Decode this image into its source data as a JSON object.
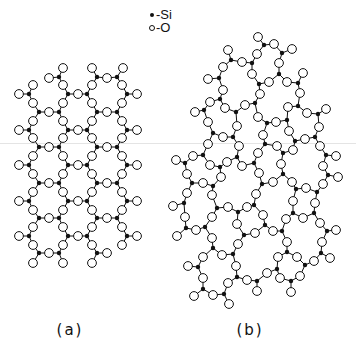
{
  "figure": {
    "width": 356,
    "height": 346,
    "colors": {
      "ink": "#111111",
      "paper": "#ffffff",
      "o_fill": "#ffffff",
      "artifact_line": "#e4e4e4"
    },
    "bond_threshold": 15.5,
    "o_radius": 4.4,
    "si_radius": 2.2
  },
  "legend": {
    "si_icon": "filled-dot",
    "si_label": "-Si",
    "o_icon": "open-circle",
    "o_label": "-O"
  },
  "panels": {
    "a": {
      "label": "(a)",
      "description": "ordered crystalline SiO2 lattice",
      "si": [
        [
          59,
          77
        ],
        [
          97,
          77
        ],
        [
          117,
          77
        ],
        [
          29,
          94
        ],
        [
          68,
          94
        ],
        [
          87,
          94
        ],
        [
          127,
          94
        ],
        [
          39,
          112
        ],
        [
          59,
          112
        ],
        [
          97,
          112
        ],
        [
          117,
          112
        ],
        [
          29,
          130
        ],
        [
          68,
          130
        ],
        [
          87,
          130
        ],
        [
          127,
          130
        ],
        [
          39,
          147
        ],
        [
          59,
          147
        ],
        [
          97,
          147
        ],
        [
          117,
          147
        ],
        [
          29,
          165
        ],
        [
          68,
          165
        ],
        [
          87,
          165
        ],
        [
          127,
          165
        ],
        [
          39,
          183
        ],
        [
          59,
          183
        ],
        [
          97,
          183
        ],
        [
          117,
          183
        ],
        [
          29,
          201
        ],
        [
          68,
          201
        ],
        [
          87,
          201
        ],
        [
          127,
          201
        ],
        [
          39,
          218
        ],
        [
          59,
          218
        ],
        [
          97,
          218
        ],
        [
          117,
          218
        ],
        [
          29,
          236
        ],
        [
          68,
          236
        ],
        [
          87,
          236
        ],
        [
          127,
          236
        ],
        [
          39,
          253
        ],
        [
          59,
          253
        ],
        [
          97,
          253
        ]
      ],
      "o": [
        [
          63,
          68
        ],
        [
          92,
          68
        ],
        [
          123,
          68
        ],
        [
          49,
          78
        ],
        [
          107,
          78
        ],
        [
          33,
          85
        ],
        [
          63,
          85
        ],
        [
          92,
          85
        ],
        [
          122,
          85
        ],
        [
          19,
          94
        ],
        [
          78,
          94
        ],
        [
          137,
          94
        ],
        [
          33,
          103
        ],
        [
          63,
          103
        ],
        [
          92,
          103
        ],
        [
          122,
          103
        ],
        [
          49,
          112
        ],
        [
          107,
          112
        ],
        [
          33,
          121
        ],
        [
          63,
          121
        ],
        [
          92,
          121
        ],
        [
          122,
          121
        ],
        [
          19,
          130
        ],
        [
          78,
          130
        ],
        [
          137,
          130
        ],
        [
          33,
          138
        ],
        [
          63,
          138
        ],
        [
          92,
          138
        ],
        [
          122,
          138
        ],
        [
          49,
          147
        ],
        [
          107,
          147
        ],
        [
          33,
          156
        ],
        [
          63,
          156
        ],
        [
          92,
          156
        ],
        [
          122,
          156
        ],
        [
          19,
          165
        ],
        [
          78,
          165
        ],
        [
          137,
          165
        ],
        [
          33,
          174
        ],
        [
          63,
          174
        ],
        [
          92,
          174
        ],
        [
          122,
          174
        ],
        [
          49,
          183
        ],
        [
          107,
          183
        ],
        [
          33,
          192
        ],
        [
          63,
          192
        ],
        [
          92,
          192
        ],
        [
          122,
          192
        ],
        [
          19,
          201
        ],
        [
          78,
          201
        ],
        [
          137,
          201
        ],
        [
          33,
          210
        ],
        [
          63,
          210
        ],
        [
          92,
          210
        ],
        [
          122,
          210
        ],
        [
          49,
          218
        ],
        [
          107,
          218
        ],
        [
          33,
          227
        ],
        [
          63,
          227
        ],
        [
          92,
          227
        ],
        [
          122,
          227
        ],
        [
          19,
          236
        ],
        [
          78,
          236
        ],
        [
          137,
          236
        ],
        [
          33,
          245
        ],
        [
          63,
          245
        ],
        [
          92,
          245
        ],
        [
          122,
          245
        ],
        [
          49,
          253
        ],
        [
          107,
          253
        ],
        [
          33,
          263
        ],
        [
          63,
          263
        ],
        [
          92,
          263
        ]
      ]
    },
    "b": {
      "label": "(b)",
      "description": "disordered amorphous SiO2 network",
      "si": [
        [
          264,
          45
        ],
        [
          282,
          53
        ],
        [
          231,
          60
        ],
        [
          252,
          63
        ],
        [
          219,
          78
        ],
        [
          279,
          74
        ],
        [
          259,
          84
        ],
        [
          298,
          83
        ],
        [
          220,
          99
        ],
        [
          255,
          103
        ],
        [
          204,
          110
        ],
        [
          236,
          112
        ],
        [
          298,
          106
        ],
        [
          318,
          114
        ],
        [
          287,
          120
        ],
        [
          267,
          123
        ],
        [
          213,
          133
        ],
        [
          233,
          137
        ],
        [
          315,
          137
        ],
        [
          295,
          141
        ],
        [
          265,
          144
        ],
        [
          203,
          155
        ],
        [
          237,
          157
        ],
        [
          185,
          163
        ],
        [
          283,
          153
        ],
        [
          326,
          155
        ],
        [
          254,
          163
        ],
        [
          220,
          167
        ],
        [
          283,
          174
        ],
        [
          328,
          175
        ],
        [
          262,
          184
        ],
        [
          192,
          183
        ],
        [
          213,
          186
        ],
        [
          296,
          189
        ],
        [
          317,
          192
        ],
        [
          184,
          203
        ],
        [
          254,
          205
        ],
        [
          217,
          208
        ],
        [
          238,
          212
        ],
        [
          293,
          213
        ],
        [
          314,
          213
        ],
        [
          186,
          228
        ],
        [
          205,
          227
        ],
        [
          265,
          225
        ],
        [
          282,
          231
        ],
        [
          327,
          231
        ],
        [
          244,
          235
        ],
        [
          213,
          248
        ],
        [
          233,
          254
        ],
        [
          287,
          252
        ],
        [
          321,
          253
        ],
        [
          198,
          267
        ],
        [
          305,
          265
        ],
        [
          277,
          269
        ],
        [
          237,
          277
        ],
        [
          257,
          281
        ],
        [
          291,
          281
        ],
        [
          203,
          289
        ],
        [
          224,
          294
        ]
      ],
      "o": [
        [
          258,
          37
        ],
        [
          274,
          44
        ],
        [
          292,
          49
        ],
        [
          228,
          50
        ],
        [
          257,
          54
        ],
        [
          242,
          62
        ],
        [
          279,
          63
        ],
        [
          223,
          67
        ],
        [
          208,
          79
        ],
        [
          252,
          74
        ],
        [
          269,
          82
        ],
        [
          287,
          82
        ],
        [
          303,
          73
        ],
        [
          223,
          90
        ],
        [
          260,
          94
        ],
        [
          300,
          93
        ],
        [
          210,
          102
        ],
        [
          245,
          105
        ],
        [
          195,
          112
        ],
        [
          225,
          108
        ],
        [
          288,
          107
        ],
        [
          307,
          113
        ],
        [
          326,
          109
        ],
        [
          258,
          117
        ],
        [
          276,
          122
        ],
        [
          208,
          122
        ],
        [
          237,
          126
        ],
        [
          319,
          127
        ],
        [
          289,
          131
        ],
        [
          263,
          135
        ],
        [
          223,
          137
        ],
        [
          305,
          139
        ],
        [
          208,
          144
        ],
        [
          239,
          146
        ],
        [
          277,
          146
        ],
        [
          293,
          150
        ],
        [
          320,
          146
        ],
        [
          258,
          153
        ],
        [
          193,
          156
        ],
        [
          176,
          160
        ],
        [
          336,
          156
        ],
        [
          227,
          162
        ],
        [
          210,
          165
        ],
        [
          242,
          166
        ],
        [
          281,
          164
        ],
        [
          323,
          166
        ],
        [
          187,
          174
        ],
        [
          259,
          173
        ],
        [
          221,
          177
        ],
        [
          338,
          177
        ],
        [
          203,
          183
        ],
        [
          273,
          182
        ],
        [
          292,
          182
        ],
        [
          306,
          188
        ],
        [
          323,
          184
        ],
        [
          187,
          193
        ],
        [
          212,
          195
        ],
        [
          256,
          194
        ],
        [
          293,
          201
        ],
        [
          315,
          203
        ],
        [
          173,
          206
        ],
        [
          228,
          207
        ],
        [
          247,
          207
        ],
        [
          185,
          217
        ],
        [
          212,
          217
        ],
        [
          263,
          215
        ],
        [
          286,
          219
        ],
        [
          303,
          218
        ],
        [
          320,
          223
        ],
        [
          237,
          224
        ],
        [
          196,
          230
        ],
        [
          177,
          236
        ],
        [
          273,
          231
        ],
        [
          255,
          233
        ],
        [
          336,
          230
        ],
        [
          212,
          238
        ],
        [
          238,
          244
        ],
        [
          287,
          242
        ],
        [
          322,
          242
        ],
        [
          203,
          257
        ],
        [
          222,
          255
        ],
        [
          278,
          257
        ],
        [
          297,
          257
        ],
        [
          330,
          258
        ],
        [
          314,
          261
        ],
        [
          188,
          266
        ],
        [
          236,
          266
        ],
        [
          267,
          273
        ],
        [
          300,
          276
        ],
        [
          203,
          278
        ],
        [
          228,
          283
        ],
        [
          247,
          280
        ],
        [
          280,
          278
        ],
        [
          257,
          291
        ],
        [
          291,
          292
        ],
        [
          194,
          296
        ],
        [
          213,
          295
        ],
        [
          229,
          304
        ]
      ]
    }
  }
}
